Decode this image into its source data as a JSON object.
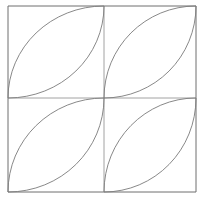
{
  "figure": {
    "background_color": "#ffffff",
    "outline_color": "#6e6e6e",
    "arc_color": "#7a7a7a",
    "midline_color": "#8a8a8a",
    "stroke_width": 1,
    "square": {
      "x": 8,
      "y": 6,
      "width": 188,
      "height": 186,
      "center_x": 104,
      "center_y": 98
    },
    "quadrants": [
      {
        "name": "top-left",
        "x": 8,
        "y": 6,
        "width": 96,
        "height": 92,
        "leaf_orientation": "bottom-left-to-top-right"
      },
      {
        "name": "top-right",
        "x": 104,
        "y": 6,
        "width": 92,
        "height": 92,
        "leaf_orientation": "bottom-left-to-top-right"
      },
      {
        "name": "bottom-left",
        "x": 8,
        "y": 98,
        "width": 96,
        "height": 94,
        "leaf_orientation": "bottom-left-to-top-right"
      },
      {
        "name": "bottom-right",
        "x": 104,
        "y": 98,
        "width": 92,
        "height": 94,
        "leaf_orientation": "bottom-left-to-top-right"
      }
    ],
    "arc_count": 8,
    "leaf_count": 4,
    "paths": {
      "square_outline": "M 8 6 L 196 6 L 196 192 L 8 192 Z",
      "vertical_midline": "M 104 6 L 104 192",
      "horizontal_midline": "M 8 98 L 196 98",
      "tl_arc_upper": "M 8 98 A 96 92 0 0 1 104 6",
      "tl_arc_lower": "M 8 98 A 96 92 0 0 0 104 6",
      "tr_arc_upper": "M 104 98 A 92 92 0 0 1 196 6",
      "tr_arc_lower": "M 104 98 A 92 92 0 0 0 196 6",
      "bl_arc_upper": "M 8 192 A 96 94 0 0 1 104 98",
      "bl_arc_lower": "M 8 192 A 96 94 0 0 0 104 98",
      "br_arc_upper": "M 104 192 A 92 94 0 0 1 196 98",
      "br_arc_lower": "M 104 192 A 92 94 0 0 0 196 98"
    }
  }
}
